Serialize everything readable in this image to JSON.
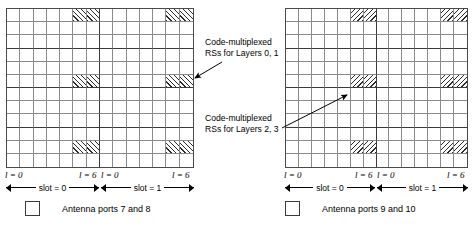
{
  "diagram": {
    "grid": {
      "rows": 12,
      "cols": 14,
      "slot_cols": 7,
      "rs_rows": [
        0,
        5,
        10
      ],
      "rs_col_pairs": [
        [
          5,
          6
        ],
        [
          12,
          13
        ]
      ]
    },
    "panels": [
      {
        "id": "left",
        "hatch": "forward",
        "legend_label": "Antenna ports 7 and 8",
        "axis": {
          "l_left_start": "l = 0",
          "l_left_end": "l = 6",
          "l_right_start": "l = 0",
          "l_right_end": "l = 6",
          "slot_left": "slot = 0",
          "slot_right": "slot = 1"
        }
      },
      {
        "id": "right",
        "hatch": "backward",
        "legend_label": "Antenna ports 9 and 10",
        "axis": {
          "l_left_start": "l = 0",
          "l_left_end": "l = 6",
          "l_right_start": "l = 0",
          "l_right_end": "l = 6",
          "slot_left": "slot = 0",
          "slot_right": "slot = 1"
        }
      }
    ],
    "annotations": [
      {
        "id": "layers01",
        "line1": "Code-multiplexed",
        "line2": "RSs for Layers 0, 1"
      },
      {
        "id": "layers23",
        "line1": "Code-multiplexed",
        "line2": "RSs for Layers 2, 3"
      }
    ],
    "colors": {
      "grid_line": "#8a8a8a",
      "grid_border": "#4a4a4a",
      "hatch": "#2b2b2b",
      "text": "#000000"
    }
  }
}
